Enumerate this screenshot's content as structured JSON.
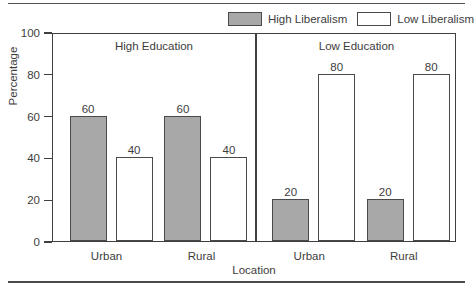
{
  "chart_data": {
    "type": "bar",
    "title": "",
    "xlabel": "Location",
    "ylabel": "Percentage",
    "ylim": [
      0,
      100
    ],
    "yticks": [
      0,
      20,
      40,
      60,
      80,
      100
    ],
    "grid": false,
    "legend_position": "top-right",
    "categories": [
      "Urban",
      "Rural"
    ],
    "panels": [
      {
        "label": "High Education",
        "categories": [
          "Urban",
          "Rural"
        ],
        "series": [
          {
            "name": "High Liberalism",
            "values": [
              60,
              60
            ],
            "color": "#a8a8a8"
          },
          {
            "name": "Low Liberalism",
            "values": [
              40,
              40
            ],
            "color": "#ffffff"
          }
        ]
      },
      {
        "label": "Low Education",
        "categories": [
          "Urban",
          "Rural"
        ],
        "series": [
          {
            "name": "High Liberalism",
            "values": [
              20,
              20
            ],
            "color": "#a8a8a8"
          },
          {
            "name": "Low Liberalism",
            "values": [
              80,
              80
            ],
            "color": "#ffffff"
          }
        ]
      }
    ],
    "legend": [
      {
        "label": "High Liberalism",
        "swatch": "filled",
        "color": "#a8a8a8"
      },
      {
        "label": "Low Liberalism",
        "swatch": "hollow",
        "color": "#ffffff"
      }
    ]
  },
  "axis": {
    "y_label": "Percentage",
    "x_label": "Location",
    "y_ticks": [
      "0",
      "20",
      "40",
      "60",
      "80",
      "100"
    ]
  },
  "panels": {
    "left_title": "High Education",
    "right_title": "Low Education"
  },
  "legend": {
    "high": "High Liberalism",
    "low": "Low Liberalism"
  },
  "x_ticks": {
    "p0c0": "Urban",
    "p0c1": "Rural",
    "p1c0": "Urban",
    "p1c1": "Rural"
  },
  "bar_values": {
    "p0_high_urban": "60",
    "p0_low_urban": "40",
    "p0_high_rural": "60",
    "p0_low_rural": "40",
    "p1_high_urban": "20",
    "p1_low_urban": "80",
    "p1_high_rural": "20",
    "p1_low_rural": "80"
  }
}
